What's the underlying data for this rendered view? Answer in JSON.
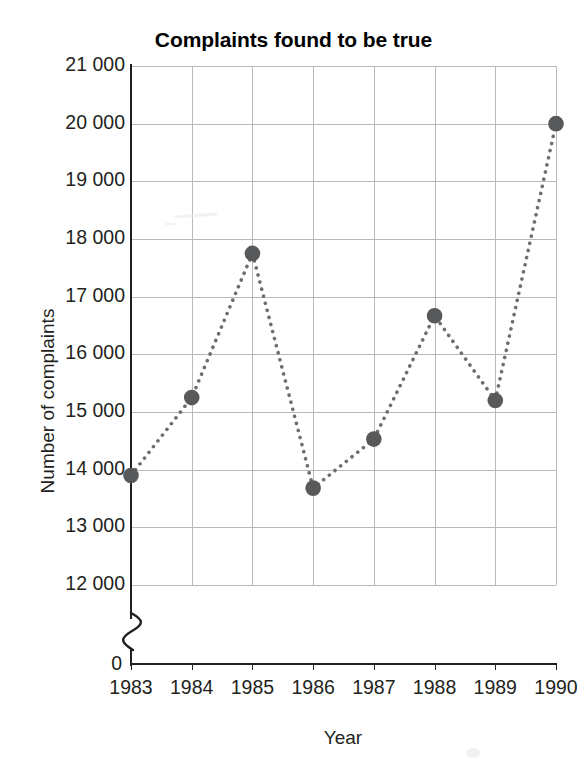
{
  "chart_data": {
    "type": "line",
    "title": "Complaints found to be true",
    "xlabel": "Year",
    "ylabel": "Number of complaints",
    "categories": [
      "1983",
      "1984",
      "1985",
      "1986",
      "1987",
      "1988",
      "1989",
      "1990"
    ],
    "x": [
      1983,
      1984,
      1985,
      1986,
      1987,
      1988,
      1989,
      1990
    ],
    "values": [
      13900,
      15250,
      17750,
      13680,
      14530,
      16670,
      15200,
      20000
    ],
    "series": [
      {
        "name": "Complaints found to be true",
        "values": [
          13900,
          15250,
          17750,
          13680,
          14530,
          16670,
          15200,
          20000
        ]
      }
    ],
    "ytick_labels": [
      "21 000",
      "20 000",
      "19 000",
      "18 000",
      "17 000",
      "16 000",
      "15 000",
      "14 000",
      "13 000",
      "12 000"
    ],
    "ytick_values": [
      21000,
      20000,
      19000,
      18000,
      17000,
      16000,
      15000,
      14000,
      13000,
      12000
    ],
    "ylim": [
      12000,
      21000
    ],
    "origin_label": "0",
    "axis_break": true,
    "grid": true,
    "legend": false,
    "marker_color": "#58595b",
    "line_style": "dotted",
    "line_color": "#6d6e71",
    "grid_color": "#b9b9b9",
    "axis_color": "#231f20"
  }
}
